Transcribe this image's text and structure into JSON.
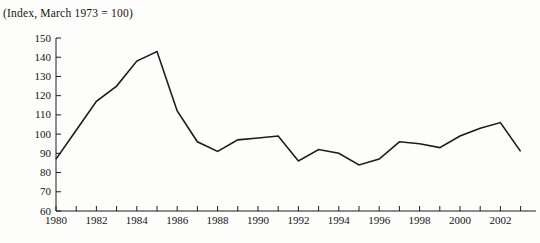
{
  "chart_data": {
    "type": "line",
    "title": "(Index, March 1973 = 100)",
    "xlabel": "",
    "ylabel": "",
    "x": [
      1980,
      1981,
      1982,
      1983,
      1984,
      1985,
      1986,
      1987,
      1988,
      1989,
      1990,
      1991,
      1992,
      1993,
      1994,
      1995,
      1996,
      1997,
      1998,
      1999,
      2000,
      2001,
      2002,
      2003
    ],
    "series": [
      {
        "name": "trade-weighted-dollar-index",
        "values": [
          87,
          102,
          117,
          125,
          138,
          143,
          112,
          96,
          91,
          97,
          98,
          99,
          86,
          92,
          90,
          84,
          87,
          96,
          95,
          93,
          99,
          103,
          106,
          91
        ]
      }
    ],
    "xlim": [
      1980,
      2003
    ],
    "ylim": [
      60,
      150
    ],
    "ytick_step": 10,
    "yticks": [
      60,
      70,
      80,
      90,
      100,
      110,
      120,
      130,
      140,
      150
    ],
    "xtick_labels": [
      1980,
      1982,
      1984,
      1986,
      1988,
      1990,
      1992,
      1994,
      1996,
      1998,
      2000,
      2002
    ],
    "grid": false,
    "legend": "none",
    "line_color": "#1c1c1c",
    "axis_color": "#1c1c1c",
    "text_color": "#141414"
  }
}
